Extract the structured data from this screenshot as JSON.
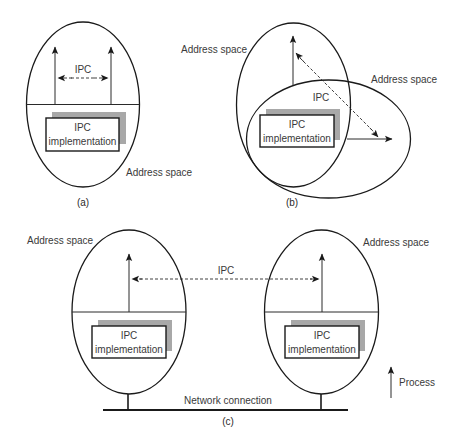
{
  "colors": {
    "stroke": "#1a1a1a",
    "shadow": "#a8a8a8",
    "text": "#3a3a3a",
    "background": "#ffffff"
  },
  "panel_a": {
    "caption": "(a)",
    "address_space_label": "Address space",
    "ipc_label": "IPC",
    "box": {
      "line1": "IPC",
      "line2": "implementation"
    }
  },
  "panel_b": {
    "caption": "(b)",
    "address_space_label_left": "Address space",
    "address_space_label_right": "Address space",
    "ipc_label": "IPC",
    "box": {
      "line1": "IPC",
      "line2": "implementation"
    }
  },
  "panel_c": {
    "caption": "(c)",
    "address_space_label_left": "Address space",
    "address_space_label_right": "Address space",
    "ipc_label": "IPC",
    "network_label": "Network connection",
    "left_box": {
      "line1": "IPC",
      "line2": "implementation"
    },
    "right_box": {
      "line1": "IPC",
      "line2": "implementation"
    }
  },
  "legend": {
    "process_label": "Process",
    "process_icon": "up-arrow-icon"
  }
}
